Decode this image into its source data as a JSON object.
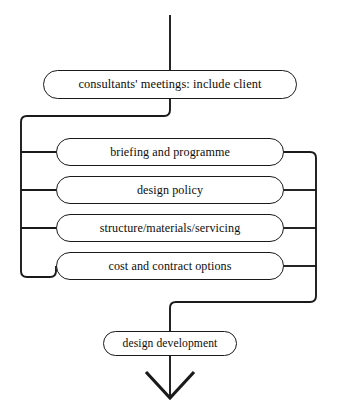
{
  "diagram": {
    "type": "flowchart",
    "background_color": "#ffffff",
    "line_color": "#1a1a1a",
    "text_color": "#0d0d0d",
    "entry": {
      "name": "inflow-line",
      "from_top": true
    },
    "top_node": {
      "id": "consultants",
      "label": "consultants' meetings: include client"
    },
    "parallel_stages": [
      {
        "id": "stage-0",
        "label": "briefing and programme"
      },
      {
        "id": "stage-1",
        "label": "design policy"
      },
      {
        "id": "stage-2",
        "label": "structure/materials/servicing"
      },
      {
        "id": "stage-3",
        "label": "cost and contract options"
      }
    ],
    "bottom_node": {
      "id": "design-development",
      "label": "design development"
    },
    "exit": {
      "name": "outflow-arrow",
      "direction": "down",
      "arrowhead": "open-chevron"
    },
    "connectors": {
      "left_bus_label": "left distribution bus",
      "right_bus_label": "right collection bus",
      "center_axis_label": "center spine"
    }
  }
}
